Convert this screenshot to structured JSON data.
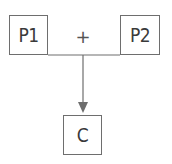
{
  "diagram": {
    "nodes": {
      "parent1": {
        "label": "P1"
      },
      "parent2": {
        "label": "P2"
      },
      "child": {
        "label": "C"
      }
    },
    "operator": {
      "symbol": "+"
    },
    "edges": [
      {
        "from": "parent1",
        "to": "parent2",
        "type": "line"
      },
      {
        "from": "parent1+parent2",
        "to": "child",
        "type": "arrow"
      }
    ],
    "colors": {
      "stroke": "#6e6e6e",
      "text": "#3a3a3a",
      "background": "#ffffff"
    }
  }
}
